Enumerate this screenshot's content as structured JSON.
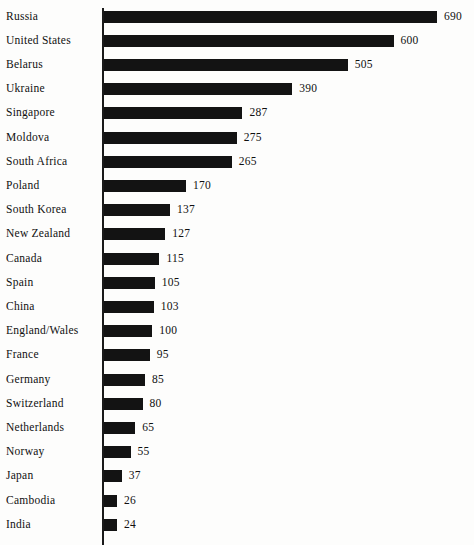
{
  "chart_data": {
    "type": "bar",
    "orientation": "horizontal",
    "title": "",
    "subtitle": "",
    "xlabel": "",
    "ylabel": "",
    "xlim": [
      0,
      690
    ],
    "grid": false,
    "legend": null,
    "value_labels_shown": true,
    "bar_color": "#131313",
    "axis_color": "#1a1a1a",
    "background_color": "#fdfdfc",
    "categories": [
      "Russia",
      "United States",
      "Belarus",
      "Ukraine",
      "Singapore",
      "Moldova",
      "South Africa",
      "Poland",
      "South Korea",
      "New Zealand",
      "Canada",
      "Spain",
      "China",
      "England/Wales",
      "France",
      "Germany",
      "Switzerland",
      "Netherlands",
      "Norway",
      "Japan",
      "Cambodia",
      "India"
    ],
    "values": [
      690,
      600,
      505,
      390,
      287,
      275,
      265,
      170,
      137,
      127,
      115,
      105,
      103,
      100,
      95,
      85,
      80,
      65,
      55,
      37,
      26,
      24
    ],
    "rows": [
      {
        "label": "Russia",
        "value": 690,
        "value_text": "690"
      },
      {
        "label": "United States",
        "value": 600,
        "value_text": "600"
      },
      {
        "label": "Belarus",
        "value": 505,
        "value_text": "505"
      },
      {
        "label": "Ukraine",
        "value": 390,
        "value_text": "390"
      },
      {
        "label": "Singapore",
        "value": 287,
        "value_text": "287"
      },
      {
        "label": "Moldova",
        "value": 275,
        "value_text": "275"
      },
      {
        "label": "South Africa",
        "value": 265,
        "value_text": "265"
      },
      {
        "label": "Poland",
        "value": 170,
        "value_text": "170"
      },
      {
        "label": "South Korea",
        "value": 137,
        "value_text": "137"
      },
      {
        "label": "New Zealand",
        "value": 127,
        "value_text": "127"
      },
      {
        "label": "Canada",
        "value": 115,
        "value_text": "115"
      },
      {
        "label": "Spain",
        "value": 105,
        "value_text": "105"
      },
      {
        "label": "China",
        "value": 103,
        "value_text": "103"
      },
      {
        "label": "England/Wales",
        "value": 100,
        "value_text": "100"
      },
      {
        "label": "France",
        "value": 95,
        "value_text": "95"
      },
      {
        "label": "Germany",
        "value": 85,
        "value_text": "85"
      },
      {
        "label": "Switzerland",
        "value": 80,
        "value_text": "80"
      },
      {
        "label": "Netherlands",
        "value": 65,
        "value_text": "65"
      },
      {
        "label": "Norway",
        "value": 55,
        "value_text": "55"
      },
      {
        "label": "Japan",
        "value": 37,
        "value_text": "37"
      },
      {
        "label": "Cambodia",
        "value": 26,
        "value_text": "26"
      },
      {
        "label": "India",
        "value": 24,
        "value_text": "24"
      }
    ]
  },
  "layout": {
    "axis_x_px": 102,
    "bar_origin_x_px": 104,
    "first_row_top_px": 3,
    "row_pitch_px": 24.2,
    "bar_height_px": 12,
    "px_per_unit": 0.4825,
    "min_bar_px": 13,
    "value_gap_px": 7
  }
}
